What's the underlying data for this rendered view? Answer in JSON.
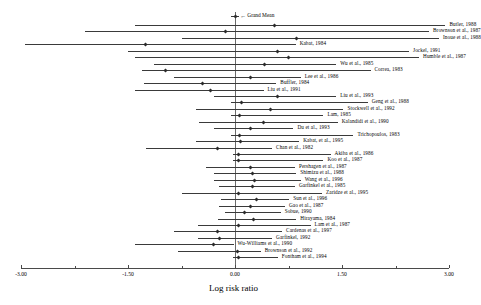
{
  "chart_data": {
    "type": "forest",
    "title": "",
    "xlabel": "Log risk ratio",
    "ylabel": "",
    "xlim": [
      -3.0,
      3.0
    ],
    "xticks": [
      -3.0,
      -1.5,
      0.0,
      1.5,
      3.0
    ],
    "xticklabels": [
      "-3.00",
      "-1.50",
      "0.00",
      "1.50",
      "3.00"
    ],
    "grid": false,
    "legend": "none",
    "reference_line": 0.0,
    "summary": {
      "label": "Grand Mean",
      "estimate": 0.0,
      "ci_low": -0.06,
      "ci_high": 0.06,
      "marker": "diamond"
    },
    "studies": [
      {
        "label": "Butler, 1988",
        "estimate": 0.55,
        "ci_low": -1.4,
        "ci_high": 2.95
      },
      {
        "label": "Brownson et al., 1987",
        "estimate": -0.13,
        "ci_low": -2.1,
        "ci_high": 2.72
      },
      {
        "label": "Inoue et al., 1988",
        "estimate": 0.86,
        "ci_low": -0.75,
        "ci_high": 2.86
      },
      {
        "label": "Kabat, 1984",
        "estimate": -1.25,
        "ci_low": -2.95,
        "ci_high": 0.85
      },
      {
        "label": "Jockel, 1991",
        "estimate": 0.59,
        "ci_low": -1.5,
        "ci_high": 2.44
      },
      {
        "label": "Humble et al., 1987",
        "estimate": 0.75,
        "ci_low": -1.4,
        "ci_high": 2.58
      },
      {
        "label": "Wu et al., 1985",
        "estimate": 0.42,
        "ci_low": -1.13,
        "ci_high": 1.42
      },
      {
        "label": "Correa, 1983",
        "estimate": -0.98,
        "ci_low": -1.3,
        "ci_high": 1.9
      },
      {
        "label": "Lee et al., 1986",
        "estimate": 0.22,
        "ci_low": -0.85,
        "ci_high": 0.92
      },
      {
        "label": "Buffler, 1984",
        "estimate": -0.45,
        "ci_low": -1.28,
        "ci_high": 0.58
      },
      {
        "label": "Liu et al., 1991",
        "estimate": -0.34,
        "ci_low": -1.4,
        "ci_high": 0.4
      },
      {
        "label": "Liu et al., 1993",
        "estimate": 0.6,
        "ci_low": -0.3,
        "ci_high": 1.42
      },
      {
        "label": "Geng et al., 1988",
        "estimate": 0.09,
        "ci_low": -0.05,
        "ci_high": 1.86
      },
      {
        "label": "Stockwell et al., 1992",
        "estimate": 0.5,
        "ci_low": -0.55,
        "ci_high": 1.52
      },
      {
        "label": "Lam, 1985",
        "estimate": 0.06,
        "ci_low": -0.05,
        "ci_high": 1.24
      },
      {
        "label": "Kalandidi et al., 1990",
        "estimate": 0.4,
        "ci_low": -0.5,
        "ci_high": 1.44
      },
      {
        "label": "Du et al., 1993",
        "estimate": 0.22,
        "ci_low": -0.3,
        "ci_high": 0.82
      },
      {
        "label": "Trichopoulos, 1983",
        "estimate": 0.07,
        "ci_low": -0.05,
        "ci_high": 1.66
      },
      {
        "label": "Kabat, et al., 1995",
        "estimate": 0.08,
        "ci_low": -0.55,
        "ci_high": 0.9
      },
      {
        "label": "Chan et al., 1982",
        "estimate": -0.25,
        "ci_low": -1.25,
        "ci_high": 0.52
      },
      {
        "label": "Akiba et al., 1986",
        "estimate": 0.05,
        "ci_low": -0.03,
        "ci_high": 1.34
      },
      {
        "label": "Koo et al., 1987",
        "estimate": 0.05,
        "ci_low": -0.03,
        "ci_high": 1.24
      },
      {
        "label": "Pershagen et al., 1987",
        "estimate": 0.22,
        "ci_low": -0.4,
        "ci_high": 0.84
      },
      {
        "label": "Shimizu et al., 1988",
        "estimate": 0.25,
        "ci_low": -0.3,
        "ci_high": 0.86
      },
      {
        "label": "Wang et al., 1996",
        "estimate": 0.28,
        "ci_low": -0.3,
        "ci_high": 0.92
      },
      {
        "label": "Garfinkel et al., 1985",
        "estimate": 0.24,
        "ci_low": -0.22,
        "ci_high": 0.84
      },
      {
        "label": "Zaridze et al., 1995",
        "estimate": 0.05,
        "ci_low": -0.75,
        "ci_high": 1.22
      },
      {
        "label": "Sun et al., 1996",
        "estimate": 0.3,
        "ci_low": -0.2,
        "ci_high": 0.76
      },
      {
        "label": "Gao et al., 1987",
        "estimate": 0.22,
        "ci_low": -0.22,
        "ci_high": 0.7
      },
      {
        "label": "Sobue, 1990",
        "estimate": 0.14,
        "ci_low": -0.14,
        "ci_high": 0.64
      },
      {
        "label": "Hirayama, 1984",
        "estimate": 0.26,
        "ci_low": -0.24,
        "ci_high": 0.86
      },
      {
        "label": "Lam et al., 1987",
        "estimate": 0.05,
        "ci_low": -0.52,
        "ci_high": 1.06
      },
      {
        "label": "Cardenas et al., 1997",
        "estimate": -0.25,
        "ci_low": -0.85,
        "ci_high": 0.66
      },
      {
        "label": "Garfinkel, 1992",
        "estimate": -0.22,
        "ci_low": -0.52,
        "ci_high": 0.52
      },
      {
        "label": "Wu-Williams et al., 1990",
        "estimate": -0.3,
        "ci_low": -1.4,
        "ci_high": -0.02
      },
      {
        "label": "Brownson et al., 1992",
        "estimate": 0.03,
        "ci_low": -0.8,
        "ci_high": 0.36
      },
      {
        "label": "Fontham et al., 1994",
        "estimate": 0.05,
        "ci_low": -0.03,
        "ci_high": 0.6
      }
    ]
  }
}
